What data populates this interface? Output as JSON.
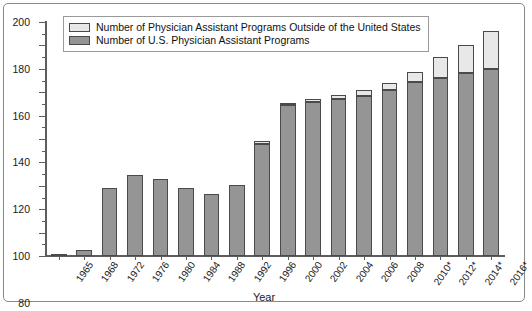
{
  "chart_data": {
    "type": "bar",
    "stacked": true,
    "title": "",
    "xlabel": "Year",
    "ylabel": "",
    "ylim": [
      0,
      200
    ],
    "ytick_step": 20,
    "yticks": [
      0,
      20,
      40,
      60,
      80,
      100,
      120,
      140,
      160,
      180,
      200
    ],
    "grid": false,
    "legend_position": "top-left",
    "categories": [
      "1965",
      "1968",
      "1972",
      "1976",
      "1980",
      "1984",
      "1988",
      "1992",
      "1996",
      "2000",
      "2002",
      "2004",
      "2006",
      "2008",
      "2010*",
      "2012*",
      "2014*",
      "2016*"
    ],
    "series": [
      {
        "name": "Number of U.S. Physician Assistant Programs",
        "color": "#959595",
        "values": [
          2,
          5,
          58,
          69,
          66,
          58,
          53,
          61,
          96,
          129,
          132,
          134,
          137,
          142,
          149,
          152,
          156,
          160
        ]
      },
      {
        "name": "Number of Physician Assistant Programs Outside of the United States",
        "color": "#e8e8e8",
        "values": [
          0,
          0,
          0,
          0,
          0,
          0,
          0,
          0,
          2,
          2,
          2,
          4,
          5,
          6,
          8,
          18,
          24,
          32
        ]
      }
    ],
    "totals": [
      2,
      5,
      58,
      69,
      66,
      58,
      53,
      61,
      98,
      131,
      134,
      138,
      142,
      148,
      157,
      170,
      180,
      192
    ]
  },
  "legend": {
    "items": [
      {
        "label": "Number of Physician Assistant Programs Outside of the United States",
        "swatch": "light"
      },
      {
        "label": "Number of U.S. Physician Assistant Programs",
        "swatch": "dark"
      }
    ]
  },
  "axis": {
    "x_title": "Year"
  }
}
